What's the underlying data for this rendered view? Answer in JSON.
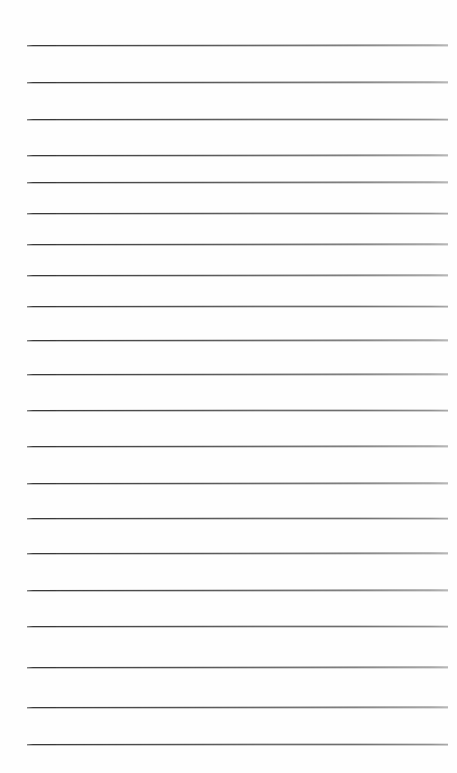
{
  "page": {
    "kind": "lined-notebook-paper",
    "width": 457,
    "height": 773,
    "background_color": "#ffffff",
    "paper_tint_color": "#fefefe"
  },
  "ruling": {
    "line_color": "#2e2e2e",
    "line_color_left_fade": "#8a8a8a",
    "line_color_right_fade": "#9a9a9a",
    "line_thickness_px": 1.25,
    "line_count": 20,
    "left_margin_px": 27,
    "right_margin_px": 9,
    "line_length_px": 421,
    "first_line_y_px": 45,
    "line_spacing_px": 36.8,
    "top_margin_px": 45,
    "bottom_margin_px": 29,
    "slight_tilt": true,
    "lines": [
      {
        "index": 1,
        "y": 45,
        "left": 27,
        "right": 448
      },
      {
        "index": 2,
        "y": 82,
        "left": 27,
        "right": 448
      },
      {
        "index": 3,
        "y": 119,
        "left": 27,
        "right": 448
      },
      {
        "index": 4,
        "y": 155,
        "left": 27,
        "right": 448
      },
      {
        "index": 5,
        "y": 182,
        "left": 27,
        "right": 448
      },
      {
        "index": 6,
        "y": 213,
        "left": 27,
        "right": 448
      },
      {
        "index": 7,
        "y": 244,
        "left": 27,
        "right": 448
      },
      {
        "index": 8,
        "y": 275,
        "left": 27,
        "right": 448
      },
      {
        "index": 9,
        "y": 306,
        "left": 27,
        "right": 448
      },
      {
        "index": 10,
        "y": 340,
        "left": 27,
        "right": 448
      },
      {
        "index": 11,
        "y": 374,
        "left": 27,
        "right": 448
      },
      {
        "index": 12,
        "y": 410,
        "left": 27,
        "right": 448
      },
      {
        "index": 13,
        "y": 446,
        "left": 27,
        "right": 448
      },
      {
        "index": 14,
        "y": 483,
        "left": 27,
        "right": 448
      },
      {
        "index": 15,
        "y": 518,
        "left": 27,
        "right": 448
      },
      {
        "index": 16,
        "y": 553,
        "left": 27,
        "right": 448
      },
      {
        "index": 17,
        "y": 590,
        "left": 27,
        "right": 448
      },
      {
        "index": 18,
        "y": 626,
        "left": 27,
        "right": 448
      },
      {
        "index": 19,
        "y": 667,
        "left": 27,
        "right": 448
      },
      {
        "index": 20,
        "y": 707,
        "left": 27,
        "right": 448
      },
      {
        "index": 21,
        "y": 744,
        "left": 27,
        "right": 448
      }
    ]
  },
  "content": {
    "written_lines": [],
    "note": ""
  }
}
